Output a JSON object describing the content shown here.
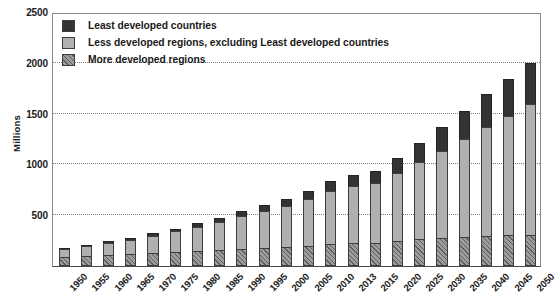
{
  "chart_data": {
    "type": "bar",
    "title": "",
    "subtitle": "",
    "xlabel": "",
    "ylabel": "Millions",
    "ylim": [
      0,
      2500
    ],
    "ytick_step": 500,
    "yticks": [
      500,
      1000,
      1500,
      2000,
      2500
    ],
    "ytick_labels": [
      "500",
      "1000",
      "1500",
      "2000",
      "2500"
    ],
    "grid": "horizontal-dotted",
    "stacked": true,
    "legend_position": "top-left-inside",
    "categories": [
      "1950",
      "1955",
      "1960",
      "1965",
      "1970",
      "1975",
      "1980",
      "1985",
      "1990",
      "1995",
      "2000",
      "2005",
      "2010",
      "2013",
      "2015",
      "2020",
      "2025",
      "2030",
      "2035",
      "2040",
      "2045",
      "2050"
    ],
    "series": [
      {
        "name": "More developed regions",
        "color": "#9d9d9d",
        "pattern": "diagonal-hatch",
        "values": [
          85,
          95,
          105,
          115,
          125,
          135,
          145,
          155,
          165,
          175,
          185,
          200,
          215,
          225,
          230,
          250,
          265,
          280,
          290,
          300,
          305,
          310
        ]
      },
      {
        "name": "Less developed regions, excluding Least developed countries",
        "color": "#b0b0b0",
        "pattern": "solid",
        "values": [
          85,
          100,
          120,
          145,
          175,
          205,
          240,
          280,
          325,
          365,
          410,
          460,
          520,
          560,
          585,
          665,
          760,
          855,
          960,
          1070,
          1175,
          1280
        ]
      },
      {
        "name": "Least developed countries",
        "color": "#333333",
        "pattern": "solid",
        "values": [
          12,
          14,
          17,
          20,
          24,
          28,
          34,
          40,
          48,
          56,
          66,
          82,
          100,
          112,
          120,
          150,
          190,
          230,
          275,
          320,
          365,
          410
        ]
      }
    ],
    "totals": [
      182,
      209,
      242,
      280,
      324,
      368,
      419,
      475,
      538,
      596,
      661,
      742,
      835,
      897,
      935,
      1065,
      1215,
      1365,
      1525,
      1690,
      1845,
      2000
    ]
  }
}
